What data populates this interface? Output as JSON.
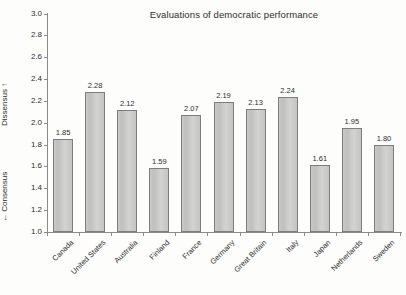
{
  "chart_data": {
    "type": "bar",
    "title": "Evaluations of democratic performance",
    "xlabel": "",
    "ylabel_top": "Dissensus ↑",
    "ylabel_bottom": "← Consensus",
    "ylim": [
      1.0,
      3.0
    ],
    "ytick_labels": [
      "3.0",
      "2.8",
      "2.6",
      "2.4",
      "2.2",
      "2.0",
      "1.8",
      "1.6",
      "1.4",
      "1.2",
      "1.0"
    ],
    "ytick_values": [
      3.0,
      2.8,
      2.6,
      2.4,
      2.2,
      2.0,
      1.8,
      1.6,
      1.4,
      1.2,
      1.0
    ],
    "grid": false,
    "legend": null,
    "bar_color": "#c9c9c9",
    "bar_border_color": "#7d7d7d",
    "axis_color": "#8a8a8a",
    "text_color": "#2d2d2d",
    "background_color": "#fdfdfc",
    "categories": [
      "Canada",
      "United States",
      "Australia",
      "Finland",
      "France",
      "Germany",
      "Great Britain",
      "Italy",
      "Japan",
      "Netherlands",
      "Sweden"
    ],
    "values": [
      1.85,
      2.28,
      2.12,
      1.59,
      2.07,
      2.19,
      2.13,
      2.24,
      1.61,
      1.95,
      1.8
    ],
    "value_labels": [
      "1.85",
      "2.28",
      "2.12",
      "1.59",
      "2.07",
      "2.19",
      "2.13",
      "2.24",
      "1.61",
      "1.95",
      "1.80"
    ]
  }
}
